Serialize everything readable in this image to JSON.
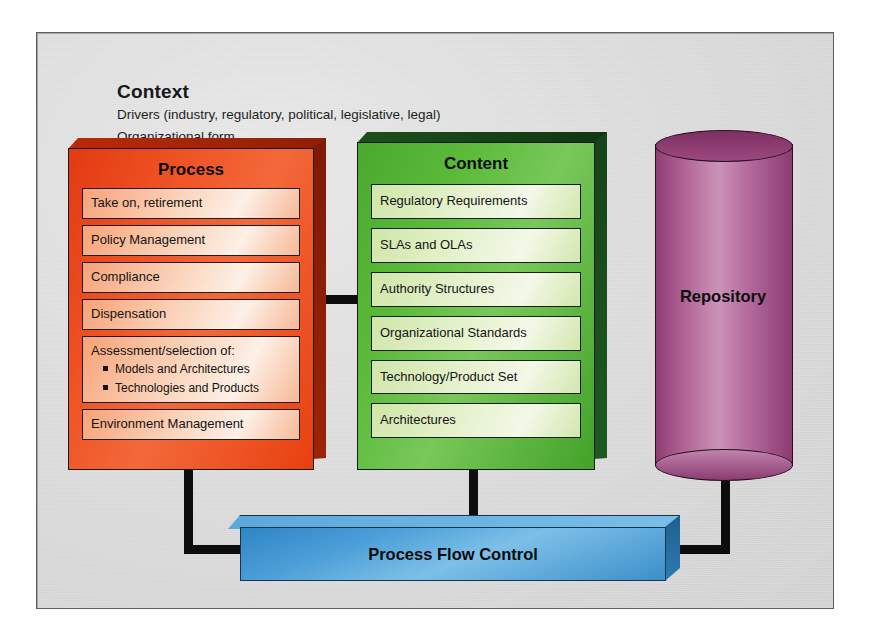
{
  "diagram": {
    "context": {
      "title": "Context",
      "line1": "Drivers (industry, regulatory, political, legislative, legal)",
      "line2": "Organizational form"
    },
    "process": {
      "title": "Process",
      "items": [
        {
          "label": "Take on, retirement"
        },
        {
          "label": "Policy Management"
        },
        {
          "label": "Compliance"
        },
        {
          "label": "Dispensation"
        },
        {
          "label": "Assessment/selection of:",
          "bullets": [
            "Models and Architectures",
            "Technologies and Products"
          ]
        },
        {
          "label": "Environment Management"
        }
      ]
    },
    "content": {
      "title": "Content",
      "items": [
        {
          "label": "Regulatory Requirements"
        },
        {
          "label": "SLAs and OLAs"
        },
        {
          "label": "Authority Structures"
        },
        {
          "label": "Organizational Standards"
        },
        {
          "label": "Technology/Product Set"
        },
        {
          "label": "Architectures"
        }
      ]
    },
    "repository": {
      "label": "Repository"
    },
    "process_flow_control": {
      "label": "Process Flow Control"
    },
    "colors": {
      "process_block": "#ef5526",
      "process_chip": "#fbd5bd",
      "content_block": "#5cbb3a",
      "content_chip": "#e6f2cf",
      "repository": "#b76da0",
      "flow_control": "#4c9fd8",
      "connector": "#0d0d0d",
      "panel_background": "#dcdcdc"
    }
  }
}
